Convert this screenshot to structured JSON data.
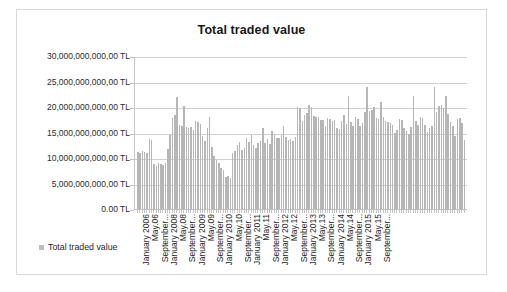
{
  "chart_data": {
    "type": "bar",
    "title": "Total traded value",
    "xlabel": "",
    "ylabel": "",
    "grid": true,
    "legend_position": "bottom-left",
    "ylim": [
      0,
      30000000000000
    ],
    "ytick_labels": [
      "30,000,000,000,00 TL",
      "25,000,000,000,00 TL",
      "20,000,000,000,00 TL",
      "15,000,000,000,00 TL",
      "10,000,000,000,00 TL",
      "5,000,000,000,00 TL",
      "0.00 TL"
    ],
    "ytick_values": [
      30,
      25,
      20,
      15,
      10,
      5,
      0
    ],
    "ytick_unit": "TL (trillions on axis scale)",
    "xtick_labels": [
      "January 2006",
      "May.06",
      "September...",
      "January 2008",
      "May.08",
      "September...",
      "January 2009",
      "May.09",
      "September...",
      "January 2010",
      "May.10",
      "September...",
      "January 2011",
      "May.11",
      "September...",
      "January 2012",
      "May.12",
      "September...",
      "January 2013",
      "May.13",
      "September...",
      "January 2014",
      "May.14",
      "September...",
      "January 2015",
      "May.15",
      "September..."
    ],
    "series": [
      {
        "name": "Total traded value",
        "color": "#b6b6b6",
        "values": [
          11.2,
          11.0,
          11.4,
          11.1,
          10.9,
          13.7,
          13.6,
          8.9,
          8.5,
          9.1,
          8.8,
          8.6,
          9.0,
          11.8,
          14.6,
          17.8,
          18.5,
          22.0,
          16.4,
          16.2,
          20.2,
          16.0,
          15.9,
          16.1,
          15.5,
          17.3,
          17.0,
          16.6,
          14.4,
          13.4,
          15.8,
          18.1,
          12.2,
          10.3,
          9.6,
          9.1,
          8.0,
          7.6,
          6.2,
          6.4,
          6.1,
          10.9,
          11.3,
          12.6,
          13.2,
          11.6,
          12.0,
          14.0,
          13.1,
          14.5,
          12.6,
          11.9,
          13.0,
          13.4,
          15.9,
          12.9,
          13.7,
          12.8,
          15.2,
          14.8,
          14.0,
          13.9,
          14.6,
          16.2,
          14.1,
          13.6,
          13.8,
          13.4,
          14.2,
          20.0,
          19.8,
          17.3,
          18.4,
          18.9,
          20.4,
          20.1,
          18.3,
          18.1,
          18.0,
          17.5,
          17.4,
          16.2,
          17.8,
          17.6,
          17.3,
          17.5,
          15.8,
          15.6,
          17.2,
          18.4,
          16.6,
          22.2,
          17.0,
          16.3,
          18.1,
          17.6,
          16.3,
          16.8,
          19.0,
          24.0,
          19.3,
          19.5,
          20.1,
          17.8,
          17.6,
          20.9,
          18.1,
          17.3,
          17.1,
          16.8,
          16.4,
          15.0,
          15.4,
          17.6,
          17.4,
          15.9,
          15.2,
          14.8,
          16.1,
          22.2,
          17.3,
          16.5,
          18.0,
          17.9,
          16.4,
          15.1,
          15.8,
          16.2,
          24.0,
          19.1,
          20.2,
          20.4,
          19.9,
          22.2,
          18.7,
          17.0,
          16.2,
          14.3,
          17.6,
          17.9,
          16.9,
          13.5
        ]
      }
    ]
  },
  "legend": {
    "label": "Total traded value"
  }
}
